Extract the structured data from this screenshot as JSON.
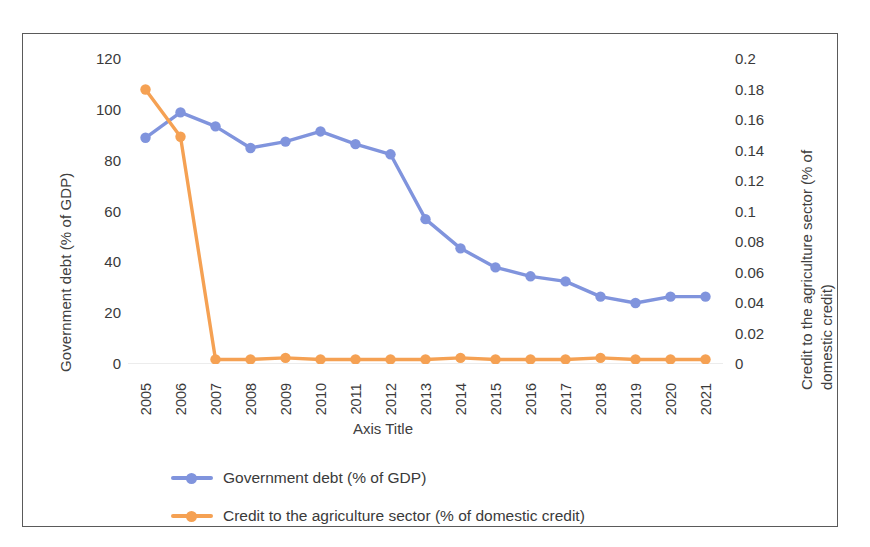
{
  "chart_data": {
    "type": "line",
    "title": "",
    "xlabel": "Axis Title",
    "grid": false,
    "legend_position": "bottom",
    "x": [
      2005,
      2006,
      2007,
      2008,
      2009,
      2010,
      2011,
      2012,
      2013,
      2014,
      2015,
      2016,
      2017,
      2018,
      2019,
      2020,
      2021
    ],
    "categories": [
      "2005",
      "2006",
      "2007",
      "2008",
      "2009",
      "2010",
      "2011",
      "2012",
      "2013",
      "2014",
      "2015",
      "2016",
      "2017",
      "2018",
      "2019",
      "2020",
      "2021"
    ],
    "axes": {
      "x": {
        "title": "Axis Title",
        "tick_labels": [
          "2005",
          "2006",
          "2007",
          "2008",
          "2009",
          "2010",
          "2011",
          "2012",
          "2013",
          "2014",
          "2015",
          "2016",
          "2017",
          "2018",
          "2019",
          "2020",
          "2021"
        ],
        "tick_rotation": 90
      },
      "y_left": {
        "title": "Government debt (% of GDP)",
        "ylim": [
          0,
          120
        ],
        "step": 20,
        "tick_labels": [
          "120",
          "100",
          "80",
          "60",
          "40",
          "20",
          "0"
        ],
        "tick_values": [
          120,
          100,
          80,
          60,
          40,
          20,
          0
        ]
      },
      "y_right": {
        "title": "Credit to the agriculture sector (% of domestic credit)",
        "ylim": [
          0,
          0.2
        ],
        "step": 0.02,
        "tick_labels": [
          "0.2",
          "0.18",
          "0.16",
          "0.14",
          "0.12",
          "0.1",
          "0.08",
          "0.06",
          "0.04",
          "0.02",
          "0"
        ],
        "tick_values": [
          0.2,
          0.18,
          0.16,
          0.14,
          0.12,
          0.1,
          0.08,
          0.06,
          0.04,
          0.02,
          0
        ]
      }
    },
    "series": [
      {
        "name": "Government debt (% of GDP)",
        "axis": "left",
        "color": "#8094DD",
        "marker": "circle",
        "values": [
          89,
          99,
          93.5,
          85,
          87.5,
          91.5,
          86.5,
          82.5,
          57,
          45.5,
          38,
          34.5,
          32.5,
          26.5,
          24,
          26.5,
          26.5
        ]
      },
      {
        "name": "Credit to the agriculture sector (% of domestic credit)",
        "axis": "right",
        "color": "#F5A153",
        "marker": "circle",
        "values": [
          0.18,
          0.149,
          0.003,
          0.003,
          0.004,
          0.003,
          0.003,
          0.003,
          0.003,
          0.004,
          0.003,
          0.003,
          0.003,
          0.004,
          0.003,
          0.003,
          0.003
        ]
      }
    ],
    "legend": [
      {
        "label": "Government debt (% of GDP)",
        "color": "#8094DD"
      },
      {
        "label": "Credit to the agriculture sector (% of domestic credit)",
        "color": "#F5A153"
      }
    ],
    "colors": {
      "series_blue": "#8094DD",
      "series_orange": "#F5A153",
      "frame": "#5a5a5a",
      "text": "#3a3a3a",
      "background": "#ffffff"
    }
  }
}
